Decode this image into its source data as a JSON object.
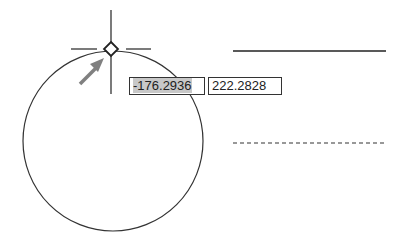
{
  "canvas": {
    "background": "#ffffff",
    "stroke_color": "#333333",
    "arrow_color": "#808080"
  },
  "dynamic_input": {
    "x_value": "-176.2936",
    "y_value": "222.2828"
  },
  "circle": {
    "cx": 113,
    "cy": 141,
    "r": 90
  },
  "lines": {
    "solid": {
      "x1": 233,
      "x2": 386,
      "y": 51
    },
    "dashed": {
      "x1": 233,
      "x2": 384,
      "y": 143
    }
  }
}
